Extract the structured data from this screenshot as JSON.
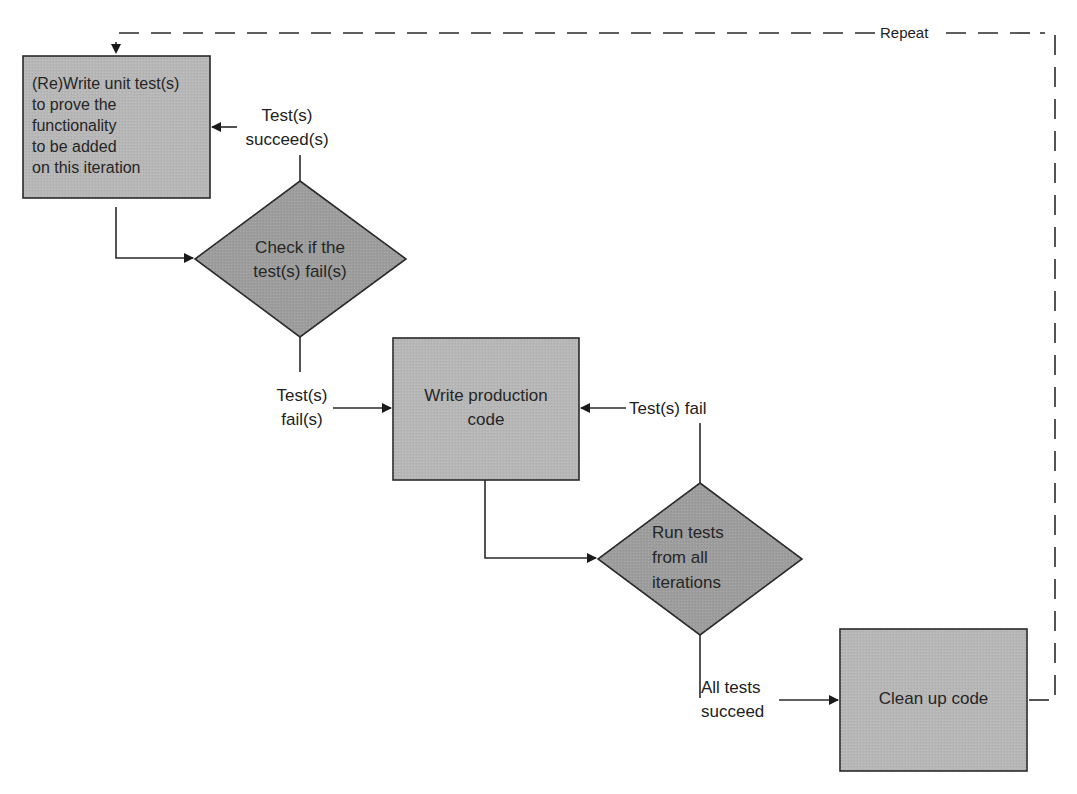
{
  "diagram": {
    "colors": {
      "box_fill": "#b4b4b4",
      "diamond_fill": "#9c9c9c",
      "stroke": "#2a2a2a",
      "text": "#222222",
      "background": "#ffffff"
    },
    "nodes": [
      {
        "id": "write-tests",
        "shape": "rectangle",
        "lines": [
          "(Re)Write unit test(s)",
          "to prove the",
          "functionality",
          "to be added",
          "on this iteration"
        ]
      },
      {
        "id": "check-fail",
        "shape": "diamond",
        "lines": [
          "Check if the",
          "test(s) fail(s)"
        ]
      },
      {
        "id": "write-code",
        "shape": "rectangle",
        "lines": [
          "Write production",
          "code"
        ]
      },
      {
        "id": "run-tests",
        "shape": "diamond",
        "lines": [
          "Run tests",
          "from all",
          "iterations"
        ]
      },
      {
        "id": "clean-up",
        "shape": "rectangle",
        "lines": [
          "Clean up code"
        ]
      }
    ],
    "edges": [
      {
        "from": "write-tests",
        "to": "check-fail",
        "label": ""
      },
      {
        "from": "check-fail",
        "to": "write-tests",
        "label_lines": [
          "Test(s)",
          "succeed(s)"
        ]
      },
      {
        "from": "check-fail",
        "to": "write-code",
        "label_lines": [
          "Test(s)",
          "fail(s)"
        ]
      },
      {
        "from": "write-code",
        "to": "run-tests",
        "label": ""
      },
      {
        "from": "run-tests",
        "to": "write-code",
        "label": "Test(s) fail"
      },
      {
        "from": "run-tests",
        "to": "clean-up",
        "label_lines": [
          "All tests",
          "succeed"
        ]
      },
      {
        "from": "clean-up",
        "to": "write-tests",
        "label": "Repeat",
        "style": "dashed"
      }
    ]
  }
}
